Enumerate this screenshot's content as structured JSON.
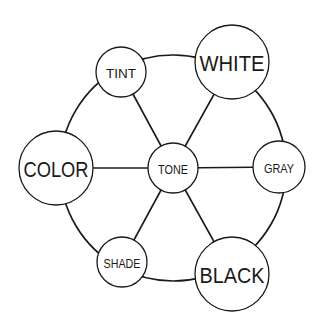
{
  "diagram": {
    "type": "hub-and-spoke network",
    "center": {
      "id": "tone",
      "label": "TONE",
      "x": 173,
      "y": 168,
      "r": 25
    },
    "nodes": [
      {
        "id": "color",
        "label": "COLOR",
        "x": 56,
        "y": 168,
        "r": 37,
        "size": "big"
      },
      {
        "id": "tint",
        "label": "TINT",
        "x": 121,
        "y": 72,
        "r": 25,
        "size": "small"
      },
      {
        "id": "white",
        "label": "WHITE",
        "x": 232,
        "y": 62,
        "r": 37,
        "size": "big"
      },
      {
        "id": "gray",
        "label": "GRAY",
        "x": 279,
        "y": 167,
        "r": 26,
        "size": "small"
      },
      {
        "id": "black",
        "label": "BLACK",
        "x": 232,
        "y": 274,
        "r": 37,
        "size": "big"
      },
      {
        "id": "shade",
        "label": "SHADE",
        "x": 122,
        "y": 262,
        "r": 25,
        "size": "small"
      }
    ],
    "spokes": [
      [
        "tone",
        "color"
      ],
      [
        "tone",
        "tint"
      ],
      [
        "tone",
        "white"
      ],
      [
        "tone",
        "gray"
      ],
      [
        "tone",
        "black"
      ],
      [
        "tone",
        "shade"
      ]
    ],
    "ring_edges": [
      [
        "color",
        "tint"
      ],
      [
        "tint",
        "white"
      ],
      [
        "white",
        "gray"
      ],
      [
        "gray",
        "black"
      ],
      [
        "black",
        "shade"
      ],
      [
        "shade",
        "color"
      ]
    ],
    "colors": {
      "stroke": "#1a1a1a",
      "fill": "#ffffff",
      "background": "#ffffff"
    }
  }
}
